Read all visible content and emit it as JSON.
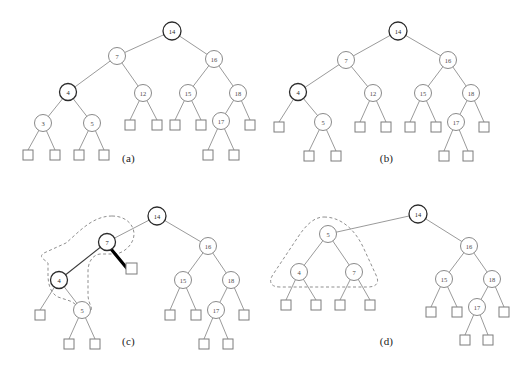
{
  "figure": {
    "panels": [
      {
        "id": "a",
        "caption": "(a)",
        "description": "Initial binary search tree with external leaf squares",
        "nodes": [
          {
            "key": "14",
            "emphasis": "dark"
          },
          {
            "key": "7",
            "emphasis": "normal"
          },
          {
            "key": "16",
            "emphasis": "normal"
          },
          {
            "key": "4",
            "emphasis": "dark"
          },
          {
            "key": "12",
            "emphasis": "normal"
          },
          {
            "key": "15",
            "emphasis": "normal"
          },
          {
            "key": "18",
            "emphasis": "normal"
          },
          {
            "key": "3",
            "emphasis": "normal"
          },
          {
            "key": "5",
            "emphasis": "normal"
          },
          {
            "key": "17",
            "emphasis": "normal"
          }
        ],
        "leaf_count": 11
      },
      {
        "id": "b",
        "caption": "(b)",
        "description": "Node 3 removed; node 4 now has a leaf as left child and node 5 as right child",
        "nodes": [
          {
            "key": "14",
            "emphasis": "dark"
          },
          {
            "key": "7",
            "emphasis": "normal"
          },
          {
            "key": "16",
            "emphasis": "normal"
          },
          {
            "key": "4",
            "emphasis": "dark"
          },
          {
            "key": "12",
            "emphasis": "normal"
          },
          {
            "key": "15",
            "emphasis": "normal"
          },
          {
            "key": "18",
            "emphasis": "normal"
          },
          {
            "key": "5",
            "emphasis": "normal"
          },
          {
            "key": "17",
            "emphasis": "normal"
          }
        ],
        "leaf_count": 10
      },
      {
        "id": "c",
        "caption": "(c)",
        "description": "Node 12 replaced by a leaf reached via a thick highlighted edge; dashed region encloses nodes 7, 4 and 5",
        "nodes": [
          {
            "key": "14",
            "emphasis": "dark"
          },
          {
            "key": "7",
            "emphasis": "dark"
          },
          {
            "key": "16",
            "emphasis": "normal"
          },
          {
            "key": "4",
            "emphasis": "dark"
          },
          {
            "key": "15",
            "emphasis": "normal"
          },
          {
            "key": "18",
            "emphasis": "normal"
          },
          {
            "key": "5",
            "emphasis": "normal"
          },
          {
            "key": "17",
            "emphasis": "normal"
          }
        ],
        "highlight": {
          "type": "thick-edge",
          "from": "7",
          "to": "leaf"
        },
        "region": {
          "type": "dashed-blob",
          "encloses": [
            "7",
            "4",
            "5"
          ]
        },
        "leaf_count": 9
      },
      {
        "id": "d",
        "caption": "(d)",
        "description": "After rotation: node 5 is the subtree root with children 4 and 7; dashed triangular region encloses 5, 4 and 7",
        "nodes": [
          {
            "key": "14",
            "emphasis": "dark"
          },
          {
            "key": "5",
            "emphasis": "normal"
          },
          {
            "key": "16",
            "emphasis": "normal"
          },
          {
            "key": "4",
            "emphasis": "normal"
          },
          {
            "key": "7",
            "emphasis": "normal"
          },
          {
            "key": "15",
            "emphasis": "normal"
          },
          {
            "key": "18",
            "emphasis": "normal"
          },
          {
            "key": "17",
            "emphasis": "normal"
          }
        ],
        "region": {
          "type": "dashed-triangle",
          "encloses": [
            "5",
            "4",
            "7"
          ]
        },
        "leaf_count": 8
      }
    ],
    "colors": {
      "node_stroke": "#8a8a8a",
      "node_stroke_dark": "#2b2b2b",
      "edge": "#8e8e8e",
      "edge_highlight": "#000000",
      "dashed_region": "#8f8f8f",
      "leaf_stroke": "#7d7d7d",
      "background": "#ffffff"
    }
  }
}
